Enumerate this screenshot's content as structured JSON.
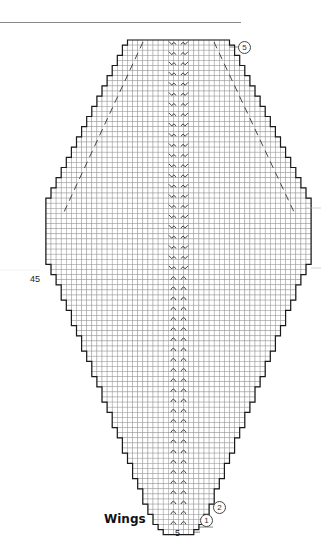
{
  "title": "Wings",
  "labels": {
    "left_row_marker": "45",
    "bottom_stitch_count": "5",
    "row_callouts": [
      "1",
      "2",
      "5"
    ]
  },
  "colors": {
    "grid_line": "#9a9a9a",
    "outline": "#1a1a1a",
    "symbol": "#333333",
    "rule": "#8a8a8a"
  },
  "chart": {
    "cell": 5.1,
    "center_x": 178.5,
    "top_y": 40,
    "rows_top_to_bottom_widths": [
      20,
      22,
      22,
      24,
      24,
      26,
      26,
      28,
      28,
      30,
      30,
      32,
      32,
      34,
      34,
      36,
      36,
      38,
      38,
      40,
      40,
      42,
      42,
      44,
      44,
      46,
      46,
      48,
      48,
      50,
      50,
      52,
      52,
      52,
      52,
      52,
      52,
      52,
      52,
      52,
      52,
      52,
      52,
      52,
      50,
      50,
      48,
      48,
      46,
      46,
      46,
      44,
      44,
      42,
      42,
      42,
      40,
      40,
      38,
      38,
      38,
      36,
      36,
      34,
      34,
      34,
      32,
      32,
      30,
      30,
      30,
      28,
      28,
      26,
      26,
      26,
      24,
      24,
      22,
      22,
      22,
      20,
      20,
      18,
      18,
      18,
      16,
      16,
      14,
      14,
      14,
      12,
      12,
      10,
      10,
      8,
      6
    ],
    "center_symbol_rows_cable": 24,
    "center_symbol_rows_arc": 70,
    "dashed_lines": [
      {
        "x1": 143,
        "y1": 42,
        "x2": 64,
        "y2": 212
      },
      {
        "x1": 214,
        "y1": 42,
        "x2": 294,
        "y2": 212
      }
    ]
  }
}
